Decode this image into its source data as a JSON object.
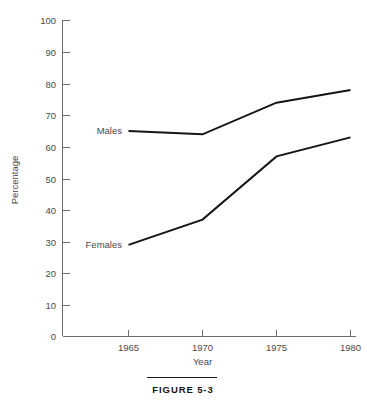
{
  "figure": {
    "caption": "FIGURE 5-3"
  },
  "chart_data": {
    "type": "line",
    "title": "",
    "xlabel": "Year",
    "ylabel": "Percentage",
    "x": [
      1965,
      1970,
      1975,
      1980
    ],
    "xticklabels": [
      "1965",
      "1970",
      "1975",
      "1980"
    ],
    "yticks": [
      0,
      10,
      20,
      30,
      40,
      50,
      60,
      70,
      80,
      90,
      100
    ],
    "yticklabels": [
      "0",
      "10",
      "20",
      "30",
      "40",
      "50",
      "60",
      "70",
      "80",
      "90",
      "100"
    ],
    "xlim": [
      1963,
      1981
    ],
    "ylim": [
      0,
      100
    ],
    "grid": false,
    "legend_position": "inline-left",
    "series": [
      {
        "name": "Males",
        "label": "Males",
        "values": [
          65,
          64,
          74,
          78
        ],
        "color": "#151515"
      },
      {
        "name": "Females",
        "label": "Females",
        "values": [
          29,
          37,
          57,
          63
        ],
        "color": "#151515"
      }
    ],
    "annotations": []
  },
  "colors": {
    "line": "#151515",
    "axis": "#6e6e6e",
    "text": "#4a4a4a",
    "background": "#ffffff"
  }
}
